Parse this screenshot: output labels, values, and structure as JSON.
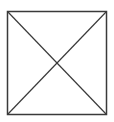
{
  "figure": {
    "shape": "square-with-diagonals",
    "icon": "placeholder-cross-box-icon",
    "stroke_color": "#3a3a3a",
    "background_color": "#ffffff",
    "box": {
      "x": 7,
      "y": 11,
      "width": 100,
      "height": 104
    }
  }
}
